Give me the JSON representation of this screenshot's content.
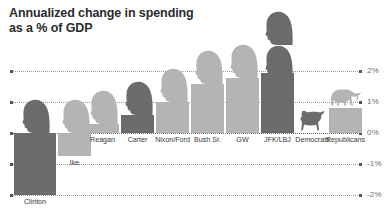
{
  "title": {
    "line1": "Annualized change in spending",
    "line2": "as a % of GDP"
  },
  "colors": {
    "dark": "#6b6b6b",
    "light": "#b4b4b4",
    "grid": "#9a9a9a",
    "text": "#3a3a3a",
    "title": "#2b2b2b",
    "background": "#ffffff"
  },
  "axis": {
    "labels": [
      "2%",
      "1%",
      "0%",
      "-1%",
      "-2%"
    ],
    "values": [
      2,
      1,
      0,
      -1,
      -2
    ]
  },
  "chart_data": {
    "type": "bar",
    "title": "Annualized change in spending as a % of GDP",
    "xlabel": "",
    "ylabel": "% of GDP",
    "ylim": [
      -2,
      2
    ],
    "grid": true,
    "legend": "none",
    "categories": [
      "Clinton",
      "Ike",
      "Reagan",
      "Carter",
      "Nixon/Ford",
      "Bush Sr.",
      "GW",
      "JFK/LBJ",
      "Democrats",
      "Republicans"
    ],
    "values": [
      -2.0,
      -0.75,
      0.3,
      0.6,
      1.0,
      1.6,
      1.8,
      1.95,
      0.0,
      0.8
    ],
    "party": [
      "democrat",
      "republican",
      "republican",
      "democrat",
      "republican",
      "republican",
      "republican",
      "democrat",
      "democrat",
      "republican"
    ],
    "icons": [
      "head",
      "head",
      "head",
      "head",
      "head",
      "head",
      "head",
      "head-double",
      "donkey",
      "elephant"
    ],
    "annotations": [
      "Clinton bar is the only negative-to-minimum bar reaching -2%",
      "JFK/LBJ shown with two stacked head silhouettes",
      "Democrats summary marked with a donkey icon at 0%",
      "Republicans summary marked with an elephant icon atop a 0.8% bar"
    ]
  },
  "bars": [
    {
      "label": "Clinton",
      "value": -2.0,
      "tone": "dark",
      "icon": "head",
      "x": 14,
      "w": 42
    },
    {
      "label": "Ike",
      "value": -0.75,
      "tone": "light",
      "icon": "head",
      "x": 58,
      "w": 33
    },
    {
      "label": "Reagan",
      "value": 0.3,
      "tone": "light",
      "icon": "head",
      "x": 86,
      "w": 33
    },
    {
      "label": "Carter",
      "value": 0.6,
      "tone": "dark",
      "icon": "head",
      "x": 121,
      "w": 33
    },
    {
      "label": "Nixon/Ford",
      "value": 1.0,
      "tone": "light",
      "icon": "head",
      "x": 156,
      "w": 33
    },
    {
      "label": "Bush Sr.",
      "value": 1.6,
      "tone": "light",
      "icon": "head",
      "x": 191,
      "w": 33
    },
    {
      "label": "GW",
      "value": 1.8,
      "tone": "light",
      "icon": "head",
      "x": 226,
      "w": 33
    },
    {
      "label": "JFK/LBJ",
      "value": 1.95,
      "tone": "dark",
      "icon": "head-double",
      "x": 261,
      "w": 33
    },
    {
      "label": "Democrats",
      "value": 0.0,
      "tone": "dark",
      "icon": "donkey",
      "x": 296,
      "w": 33
    },
    {
      "label": "Republicans",
      "value": 0.8,
      "tone": "light",
      "icon": "elephant",
      "x": 329,
      "w": 33
    }
  ]
}
